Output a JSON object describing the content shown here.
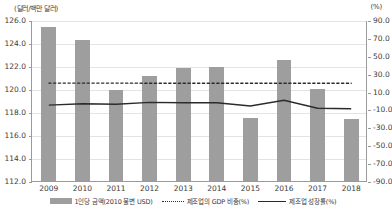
{
  "chart_data": {
    "type": "bar",
    "title": "",
    "xlabel": "",
    "ylabel": "(달러/백만 달러)",
    "y2label": "(%)",
    "grid": true,
    "legend_position": "bottom",
    "categories": [
      "2009",
      "2010",
      "2011",
      "2012",
      "2013",
      "2014",
      "2015",
      "2016",
      "2017",
      "2018"
    ],
    "ylim": [
      112.0,
      126.0
    ],
    "ytick_labels": [
      "126.0",
      "124.0",
      "122.0",
      "120.0",
      "118.0",
      "116.0",
      "114.0",
      "112.0"
    ],
    "ytick_values": [
      126.0,
      124.0,
      122.0,
      120.0,
      118.0,
      116.0,
      114.0,
      112.0
    ],
    "y2lim": [
      -90.0,
      90.0
    ],
    "y2tick_labels": [
      "90.0",
      "70.0",
      "50.0",
      "30.0",
      "10.0",
      "-10.0",
      "-30.0",
      "-50.0",
      "-70.0",
      "-90.0"
    ],
    "y2tick_values": [
      90.0,
      70.0,
      50.0,
      30.0,
      10.0,
      -10.0,
      -30.0,
      -50.0,
      -70.0,
      -90.0
    ],
    "series": [
      {
        "name": "1인당 금액(2010 불변 USD)",
        "type": "bar",
        "axis": "left",
        "color": "#9e9e9e",
        "values": [
          125.4,
          124.3,
          119.9,
          121.1,
          121.8,
          121.9,
          117.5,
          122.5,
          120.0,
          117.4
        ]
      },
      {
        "name": "제조업의 GDP 비중(%)",
        "type": "line",
        "style": "dotted",
        "axis": "right",
        "color": "#2b2b2b",
        "values": [
          20.6,
          20.6,
          20.6,
          20.5,
          20.5,
          20.5,
          20.5,
          20.5,
          20.4,
          20.4
        ]
      },
      {
        "name": "제조업 성장률(%)",
        "type": "line",
        "style": "solid",
        "axis": "right",
        "color": "#2b2b2b",
        "values": [
          -4.0,
          -2.5,
          -3.0,
          -1.0,
          -1.5,
          -1.5,
          -5.0,
          1.5,
          -7.5,
          -8.0
        ]
      }
    ]
  },
  "legend": {
    "items": [
      {
        "label": "1인당 금액(2010 불변 USD)",
        "marker": "bar-swatch"
      },
      {
        "label": "제조업의 GDP 비중(%)",
        "marker": "dotted-line-swatch"
      },
      {
        "label": "제조업 성장률(%)",
        "marker": "solid-line-swatch"
      }
    ]
  }
}
